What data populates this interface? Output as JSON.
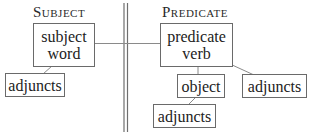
{
  "headers": {
    "subject": "Subject",
    "predicate": "Predicate"
  },
  "nodes": {
    "subject_word": {
      "line1": "subject",
      "line2": "word"
    },
    "predicate_verb": {
      "line1": "predicate",
      "line2": "verb"
    },
    "subject_adjuncts": {
      "label": "adjuncts"
    },
    "object": {
      "label": "object"
    },
    "predicate_adjuncts": {
      "label": "adjuncts"
    },
    "object_adjuncts": {
      "label": "adjuncts"
    }
  },
  "colors": {
    "line": "#7a7a7a",
    "text": "#222222",
    "background": "#ffffff"
  }
}
